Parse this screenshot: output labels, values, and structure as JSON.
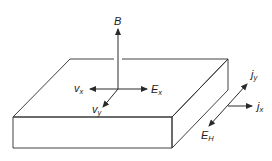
{
  "diagram": {
    "type": "hall-effect-slab",
    "colors": {
      "stroke": "#2a2a2a",
      "background": "#ffffff",
      "text": "#222222"
    },
    "labels": {
      "B": {
        "main": "B",
        "sub": ""
      },
      "Ex": {
        "main": "E",
        "sub": "x"
      },
      "vx": {
        "main": "v",
        "sub": "x"
      },
      "vy": {
        "main": "v",
        "sub": "y"
      },
      "jy": {
        "main": "j",
        "sub": "y"
      },
      "jx": {
        "main": "j",
        "sub": "x"
      },
      "EH": {
        "main": "E",
        "sub": "H"
      }
    },
    "slab": {
      "top_face": [
        [
          70,
          59
        ],
        [
          228,
          59
        ],
        [
          172,
          117
        ],
        [
          13,
          117
        ]
      ],
      "front_face": [
        [
          13,
          117
        ],
        [
          172,
          117
        ],
        [
          172,
          148
        ],
        [
          13,
          148
        ]
      ],
      "right_face": [
        [
          172,
          117
        ],
        [
          228,
          59
        ],
        [
          228,
          90
        ],
        [
          172,
          148
        ]
      ]
    },
    "arrows": [
      {
        "name": "B",
        "from": [
          118,
          89
        ],
        "to": [
          118,
          28
        ]
      },
      {
        "name": "Ex",
        "from": [
          118,
          89
        ],
        "to": [
          148,
          89
        ]
      },
      {
        "name": "vx",
        "from": [
          118,
          89
        ],
        "to": [
          89,
          89
        ]
      },
      {
        "name": "vy",
        "from": [
          118,
          89
        ],
        "to": [
          102,
          108
        ]
      },
      {
        "name": "jy-EH",
        "from": [
          208,
          127
        ],
        "to": [
          248,
          83
        ],
        "double": true
      },
      {
        "name": "jx",
        "from": [
          228,
          106
        ],
        "to": [
          253,
          106
        ]
      }
    ]
  }
}
